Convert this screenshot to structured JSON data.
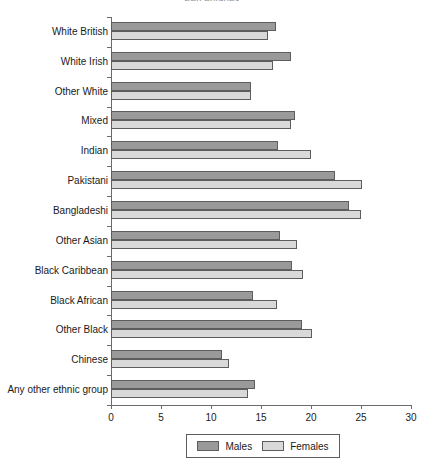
{
  "chart_data": {
    "type": "bar",
    "orientation": "horizontal",
    "title": "Percentages",
    "xlabel": "",
    "ylabel": "",
    "xlim": [
      0,
      30
    ],
    "xticks": [
      0,
      5,
      10,
      15,
      20,
      25,
      30
    ],
    "grid": false,
    "legend_position": "bottom",
    "categories": [
      "White British",
      "White Irish",
      "Other White",
      "Mixed",
      "Indian",
      "Pakistani",
      "Bangladeshi",
      "Other Asian",
      "Black Caribbean",
      "Black African",
      "Other Black",
      "Chinese",
      "Any other ethnic group"
    ],
    "series": [
      {
        "name": "Males",
        "color": "#9a9a9a",
        "values": [
          16.5,
          18.0,
          14.0,
          18.4,
          16.7,
          22.4,
          23.8,
          16.9,
          18.1,
          14.2,
          19.1,
          11.1,
          14.4
        ]
      },
      {
        "name": "Females",
        "color": "#d9d9d9",
        "values": [
          15.7,
          16.2,
          14.0,
          18.0,
          20.0,
          25.1,
          25.0,
          18.6,
          19.2,
          16.6,
          20.1,
          11.8,
          13.7
        ]
      }
    ]
  }
}
